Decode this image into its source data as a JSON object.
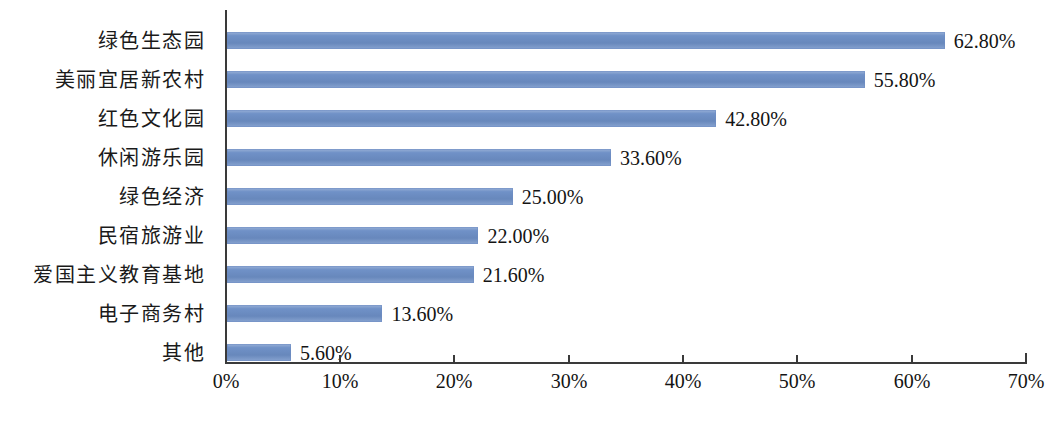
{
  "chart_data": {
    "type": "bar",
    "orientation": "horizontal",
    "title": "",
    "subtitle": "",
    "xlabel": "",
    "ylabel": "",
    "xlim": [
      0,
      70
    ],
    "grid": false,
    "legend": null,
    "axis_unit": "%",
    "xticks": [
      "0%",
      "10%",
      "20%",
      "30%",
      "40%",
      "50%",
      "60%",
      "70%"
    ],
    "xtick_values": [
      0,
      10,
      20,
      30,
      40,
      50,
      60,
      70
    ],
    "categories": [
      "绿色生态园",
      "美丽宜居新农村",
      "红色文化园",
      "休闲游乐园",
      "绿色经济",
      "民宿旅游业",
      "爱国主义教育基地",
      "电子商务村",
      "其他"
    ],
    "values": [
      62.8,
      55.8,
      42.8,
      33.6,
      25.0,
      22.0,
      21.6,
      13.6,
      5.6
    ],
    "data_labels": [
      "62.80%",
      "55.80%",
      "42.80%",
      "33.60%",
      "25.00%",
      "22.00%",
      "21.60%",
      "13.60%",
      "5.60%"
    ],
    "colors": {
      "bar": "#6d8fc6",
      "axis": "#3a3a3a",
      "text": "#141414",
      "background": "#ffffff"
    }
  }
}
